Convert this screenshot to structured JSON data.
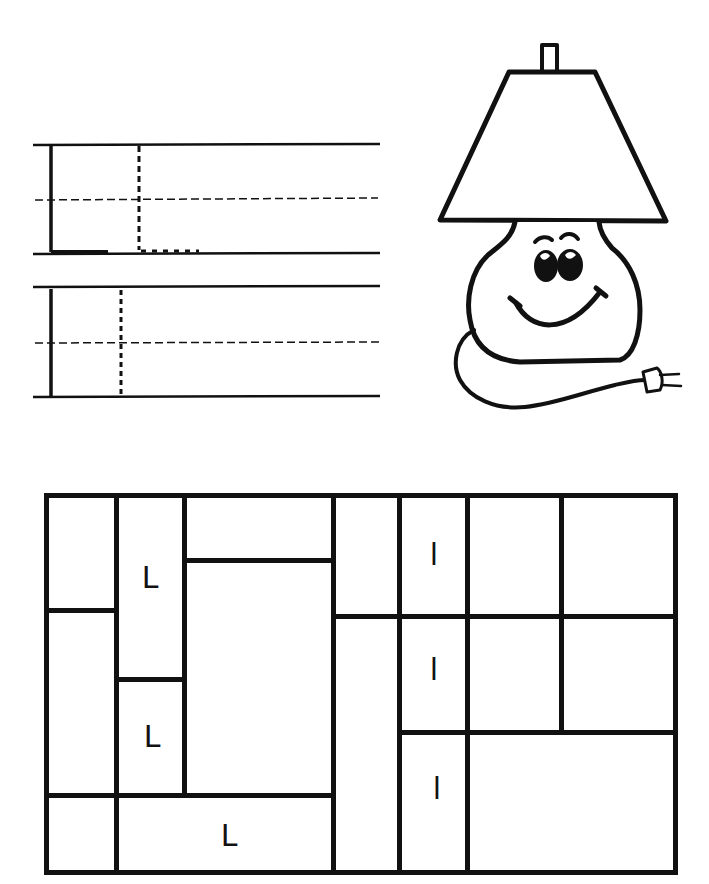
{
  "worksheet": {
    "title_letter_upper": "L",
    "title_letter_lower": "l",
    "picture": "lamp-with-smiling-face",
    "handwriting_rows": [
      {
        "letter": "L",
        "guide": "traced-dashed-L"
      },
      {
        "letter": "l",
        "guide": "traced-dashed-l"
      }
    ],
    "grid": {
      "colors": {
        "line": "#111111",
        "background": "#ffffff"
      },
      "cells": [
        {
          "id": "c1",
          "letter": ""
        },
        {
          "id": "c2",
          "letter": ""
        },
        {
          "id": "c3",
          "letter": ""
        },
        {
          "id": "c4",
          "letter": "L"
        },
        {
          "id": "c5",
          "letter": "L"
        },
        {
          "id": "c6",
          "letter": ""
        },
        {
          "id": "c7",
          "letter": ""
        },
        {
          "id": "c8",
          "letter": "L"
        },
        {
          "id": "c9",
          "letter": ""
        },
        {
          "id": "c10",
          "letter": ""
        },
        {
          "id": "c11",
          "letter": "l"
        },
        {
          "id": "c12",
          "letter": "l"
        },
        {
          "id": "c13",
          "letter": "l"
        },
        {
          "id": "c14",
          "letter": ""
        },
        {
          "id": "c15",
          "letter": ""
        },
        {
          "id": "c16",
          "letter": ""
        },
        {
          "id": "c17",
          "letter": ""
        },
        {
          "id": "c18",
          "letter": ""
        }
      ]
    }
  }
}
